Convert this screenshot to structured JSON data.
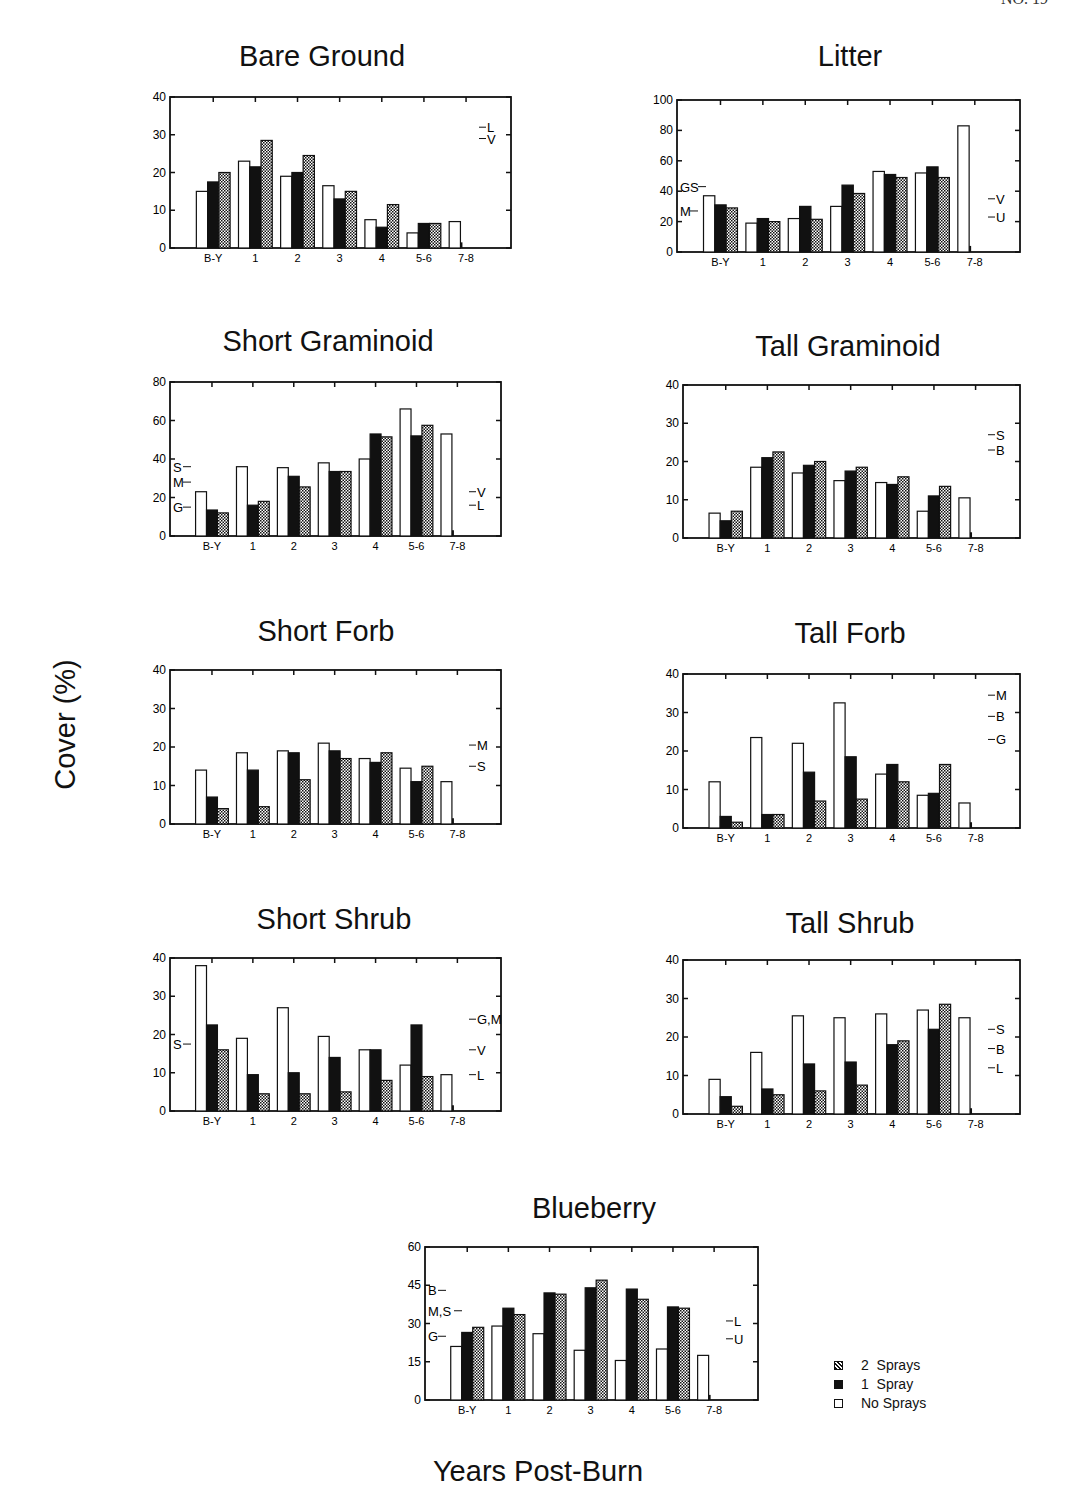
{
  "page": {
    "header_text": "NO. 19",
    "y_axis_label": "Cover (%)",
    "x_axis_label": "Years Post-Burn"
  },
  "legend": {
    "items": [
      {
        "label": "2  Sprays",
        "swatch": "hatched"
      },
      {
        "label": "1  Spray",
        "swatch": "solid"
      },
      {
        "label": "No Sprays",
        "swatch": "open"
      }
    ]
  },
  "chart_data": [
    {
      "type": "bar",
      "title": "Bare Ground",
      "categories": [
        "B-Y",
        "1",
        "2",
        "3",
        "4",
        "5-6",
        "7-8"
      ],
      "ylim": [
        0,
        40
      ],
      "yticks": [
        0,
        10,
        20,
        30,
        40
      ],
      "series": [
        {
          "name": "No Sprays",
          "values": [
            15,
            23,
            19,
            16.5,
            7.5,
            4,
            7
          ]
        },
        {
          "name": "1 Spray",
          "values": [
            17.5,
            21.5,
            20,
            13,
            5.5,
            6.5,
            null
          ]
        },
        {
          "name": "2 Sprays",
          "values": [
            20,
            28.5,
            24.5,
            15,
            11.5,
            6.5,
            null
          ]
        }
      ],
      "trace_7_8": 1.5,
      "left_annotations": [],
      "right_annotations": [
        {
          "text": "L",
          "y": 32
        },
        {
          "text": "V",
          "y": 29
        }
      ]
    },
    {
      "type": "bar",
      "title": "Litter",
      "categories": [
        "B-Y",
        "1",
        "2",
        "3",
        "4",
        "5-6",
        "7-8"
      ],
      "ylim": [
        0,
        100
      ],
      "yticks": [
        0,
        20,
        40,
        60,
        80,
        100
      ],
      "series": [
        {
          "name": "No Sprays",
          "values": [
            37,
            19,
            22,
            30,
            53,
            52,
            83
          ]
        },
        {
          "name": "1 Spray",
          "values": [
            31,
            22,
            30,
            44,
            51,
            56,
            null
          ]
        },
        {
          "name": "2 Sprays",
          "values": [
            29,
            20,
            21.5,
            38.5,
            49,
            49,
            null
          ]
        }
      ],
      "trace_7_8": 4,
      "left_annotations": [
        {
          "text": "GS",
          "y": 43
        },
        {
          "text": "M",
          "y": 27
        }
      ],
      "right_annotations": [
        {
          "text": "V",
          "y": 35
        },
        {
          "text": "U",
          "y": 23
        }
      ]
    },
    {
      "type": "bar",
      "title": "Short Graminoid",
      "categories": [
        "B-Y",
        "1",
        "2",
        "3",
        "4",
        "5-6",
        "7-8"
      ],
      "ylim": [
        0,
        80
      ],
      "yticks": [
        0,
        20,
        40,
        60,
        80
      ],
      "series": [
        {
          "name": "No Sprays",
          "values": [
            23,
            36,
            35.5,
            38,
            40,
            66,
            53
          ]
        },
        {
          "name": "1 Spray",
          "values": [
            13.5,
            16,
            31,
            33.5,
            53,
            52,
            null
          ]
        },
        {
          "name": "2 Sprays",
          "values": [
            12,
            18,
            25.5,
            33.5,
            51.5,
            57.5,
            null
          ]
        }
      ],
      "trace_7_8": 3,
      "left_annotations": [
        {
          "text": "S",
          "y": 36
        },
        {
          "text": "M",
          "y": 28
        },
        {
          "text": "G",
          "y": 15
        }
      ],
      "right_annotations": [
        {
          "text": "V",
          "y": 23
        },
        {
          "text": "L",
          "y": 16
        }
      ]
    },
    {
      "type": "bar",
      "title": "Tall Graminoid",
      "categories": [
        "B-Y",
        "1",
        "2",
        "3",
        "4",
        "5-6",
        "7-8"
      ],
      "ylim": [
        0,
        40
      ],
      "yticks": [
        0,
        10,
        20,
        30,
        40
      ],
      "series": [
        {
          "name": "No Sprays",
          "values": [
            6.5,
            18.5,
            17,
            15,
            14.5,
            7,
            10.5
          ]
        },
        {
          "name": "1 Spray",
          "values": [
            4.5,
            21,
            19,
            17.5,
            14,
            11,
            null
          ]
        },
        {
          "name": "2 Sprays",
          "values": [
            7,
            22.5,
            20,
            18.5,
            16,
            13.5,
            null
          ]
        }
      ],
      "trace_7_8": 1.5,
      "left_annotations": [],
      "right_annotations": [
        {
          "text": "S",
          "y": 27
        },
        {
          "text": "B",
          "y": 23
        }
      ]
    },
    {
      "type": "bar",
      "title": "Short Forb",
      "categories": [
        "B-Y",
        "1",
        "2",
        "3",
        "4",
        "5-6",
        "7-8"
      ],
      "ylim": [
        0,
        40
      ],
      "yticks": [
        0,
        10,
        20,
        30,
        40
      ],
      "series": [
        {
          "name": "No Sprays",
          "values": [
            14,
            18.5,
            19,
            21,
            17,
            14.5,
            11
          ]
        },
        {
          "name": "1 Spray",
          "values": [
            7,
            14,
            18.5,
            19,
            16,
            11,
            null
          ]
        },
        {
          "name": "2 Sprays",
          "values": [
            4,
            4.5,
            11.5,
            17,
            18.5,
            15,
            null
          ]
        }
      ],
      "trace_7_8": 1.5,
      "left_annotations": [],
      "right_annotations": [
        {
          "text": "M",
          "y": 20.5
        },
        {
          "text": "S",
          "y": 15
        }
      ]
    },
    {
      "type": "bar",
      "title": "Tall Forb",
      "categories": [
        "B-Y",
        "1",
        "2",
        "3",
        "4",
        "5-6",
        "7-8"
      ],
      "ylim": [
        0,
        40
      ],
      "yticks": [
        0,
        10,
        20,
        30,
        40
      ],
      "series": [
        {
          "name": "No Sprays",
          "values": [
            12,
            23.5,
            22,
            32.5,
            14,
            8.5,
            6.5
          ]
        },
        {
          "name": "1 Spray",
          "values": [
            3,
            3.5,
            14.5,
            18.5,
            16.5,
            9,
            null
          ]
        },
        {
          "name": "2 Sprays",
          "values": [
            1.5,
            3.5,
            7,
            7.5,
            12,
            16.5,
            null
          ]
        }
      ],
      "trace_7_8": 1.5,
      "left_annotations": [],
      "right_annotations": [
        {
          "text": "M",
          "y": 34.5
        },
        {
          "text": "B",
          "y": 29
        },
        {
          "text": "G",
          "y": 23
        }
      ]
    },
    {
      "type": "bar",
      "title": "Short Shrub",
      "categories": [
        "B-Y",
        "1",
        "2",
        "3",
        "4",
        "5-6",
        "7-8"
      ],
      "ylim": [
        0,
        40
      ],
      "yticks": [
        0,
        10,
        20,
        30,
        40
      ],
      "series": [
        {
          "name": "No Sprays",
          "values": [
            38,
            19,
            27,
            19.5,
            16,
            12,
            9.5
          ]
        },
        {
          "name": "1 Spray",
          "values": [
            22.5,
            9.5,
            10,
            14,
            16,
            22.5,
            null
          ]
        },
        {
          "name": "2 Sprays",
          "values": [
            16,
            4.5,
            4.5,
            5,
            8,
            9,
            null
          ]
        }
      ],
      "trace_7_8": 1.5,
      "left_annotations": [
        {
          "text": "S",
          "y": 17.5
        }
      ],
      "right_annotations": [
        {
          "text": "G,M",
          "y": 24
        },
        {
          "text": "V",
          "y": 16
        },
        {
          "text": "L",
          "y": 9.5
        }
      ]
    },
    {
      "type": "bar",
      "title": "Tall Shrub",
      "categories": [
        "B-Y",
        "1",
        "2",
        "3",
        "4",
        "5-6",
        "7-8"
      ],
      "ylim": [
        0,
        40
      ],
      "yticks": [
        0,
        10,
        20,
        30,
        40
      ],
      "series": [
        {
          "name": "No Sprays",
          "values": [
            9,
            16,
            25.5,
            25,
            26,
            27,
            25
          ]
        },
        {
          "name": "1 Spray",
          "values": [
            4.5,
            6.5,
            13,
            13.5,
            18,
            22,
            null
          ]
        },
        {
          "name": "2 Sprays",
          "values": [
            2,
            5,
            6,
            7.5,
            19,
            28.5,
            null
          ]
        }
      ],
      "trace_7_8": 1.5,
      "left_annotations": [],
      "right_annotations": [
        {
          "text": "S",
          "y": 22
        },
        {
          "text": "B",
          "y": 17
        },
        {
          "text": "L",
          "y": 12
        }
      ]
    },
    {
      "type": "bar",
      "title": "Blueberry",
      "categories": [
        "B-Y",
        "1",
        "2",
        "3",
        "4",
        "5-6",
        "7-8"
      ],
      "ylim": [
        0,
        60
      ],
      "yticks": [
        0,
        15,
        30,
        45,
        60
      ],
      "series": [
        {
          "name": "No Sprays",
          "values": [
            21,
            29,
            26,
            19.5,
            15.5,
            20,
            17.5
          ]
        },
        {
          "name": "1 Spray",
          "values": [
            26.5,
            36,
            42,
            44,
            43.5,
            36.5,
            null
          ]
        },
        {
          "name": "2 Sprays",
          "values": [
            28.5,
            33.5,
            41.5,
            47,
            39.5,
            36,
            null
          ]
        }
      ],
      "trace_7_8": 2,
      "left_annotations": [
        {
          "text": "B",
          "y": 43
        },
        {
          "text": "M,S",
          "y": 35
        },
        {
          "text": "G",
          "y": 25
        }
      ],
      "right_annotations": [
        {
          "text": "L",
          "y": 31
        },
        {
          "text": "U",
          "y": 24
        }
      ]
    }
  ]
}
